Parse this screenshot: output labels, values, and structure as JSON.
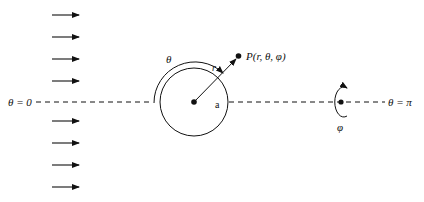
{
  "diagram": {
    "type": "spherical-coordinates-flow-past-sphere",
    "labels": {
      "theta_zero": "θ = 0",
      "theta_pi": "θ = π",
      "theta": "θ",
      "point": "P(r, θ, φ)",
      "r": "r",
      "a": "a",
      "phi": "φ"
    },
    "flow_arrows": {
      "count": 8,
      "direction": "right",
      "y_positions": [
        15,
        37,
        59,
        81,
        121,
        143,
        165,
        187
      ],
      "x_start": 52,
      "x_end": 79
    },
    "sphere": {
      "cx": 194,
      "cy": 102,
      "r": 34
    },
    "axis": {
      "y": 102,
      "style": "dashed"
    },
    "colors": {
      "stroke": "#111111",
      "background": "#ffffff"
    }
  }
}
